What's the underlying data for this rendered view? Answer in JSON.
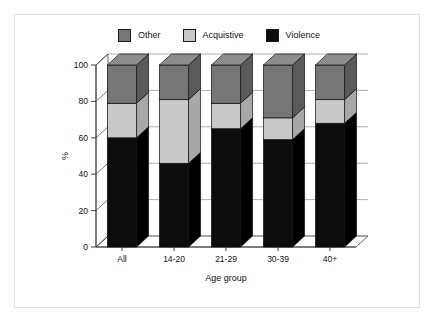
{
  "chart_data": {
    "type": "bar",
    "subtype": "stacked-3d-column",
    "title": "",
    "xlabel": "Age group",
    "ylabel": "%",
    "categories": [
      "All",
      "14-20",
      "21-29",
      "30-39",
      "40+"
    ],
    "series": [
      {
        "name": "Violence",
        "values": [
          60,
          46,
          65,
          59,
          68
        ],
        "color": "#0d0d0d"
      },
      {
        "name": "Acquistive",
        "values": [
          19,
          35,
          14,
          12,
          13
        ],
        "color": "#c9c9c9"
      },
      {
        "name": "Other",
        "values": [
          21,
          19,
          21,
          29,
          19
        ],
        "color": "#767676"
      }
    ],
    "stack_order_bottom_to_top": [
      "Violence",
      "Acquistive",
      "Other"
    ],
    "ylim": [
      0,
      100
    ],
    "yticks": [
      0,
      20,
      40,
      60,
      80,
      100
    ],
    "ytick_labels": [
      "0",
      "20",
      "40",
      "60",
      "80",
      "100"
    ],
    "xtick_labels": [
      "All",
      "14-20",
      "21-29",
      "30-39",
      "40+"
    ],
    "grid": "horizontal",
    "legend_position": "top",
    "cumulative_tops": {
      "All": {
        "violence": 60,
        "acquistive": 79,
        "other": 100
      },
      "14-20": {
        "violence": 46,
        "acquistive": 81,
        "other": 100
      },
      "21-29": {
        "violence": 65,
        "acquistive": 79,
        "other": 100
      },
      "30-39": {
        "violence": 59,
        "acquistive": 71,
        "other": 100
      },
      "40+": {
        "violence": 68,
        "acquistive": 81,
        "other": 100
      }
    }
  },
  "legend": {
    "items": [
      {
        "label": "Other",
        "color": "#767676"
      },
      {
        "label": "Acquistive",
        "color": "#c9c9c9"
      },
      {
        "label": "Violence",
        "color": "#0d0d0d"
      }
    ]
  },
  "axes": {
    "y_axis_title": "%",
    "x_axis_title": "Age group",
    "y_tick_labels": [
      "100",
      "80",
      "60",
      "40",
      "20",
      "0"
    ],
    "x_tick_labels": [
      "All",
      "14-20",
      "21-29",
      "30-39",
      "40+"
    ]
  },
  "colors": {
    "violence": "#0d0d0d",
    "acquistive": "#c9c9c9",
    "other": "#767676",
    "violence_top": "#2b2b2b",
    "violence_side": "#000000",
    "acquistive_top": "#dcdcdc",
    "acquistive_side": "#a8a8a8",
    "other_top": "#8d8d8d",
    "other_side": "#5a5a5a",
    "floor": "#ffffff",
    "axis_line": "#444444",
    "grid_line": "#8c8c8c",
    "frame_border": "#e2e2e2",
    "background": "#ffffff"
  }
}
